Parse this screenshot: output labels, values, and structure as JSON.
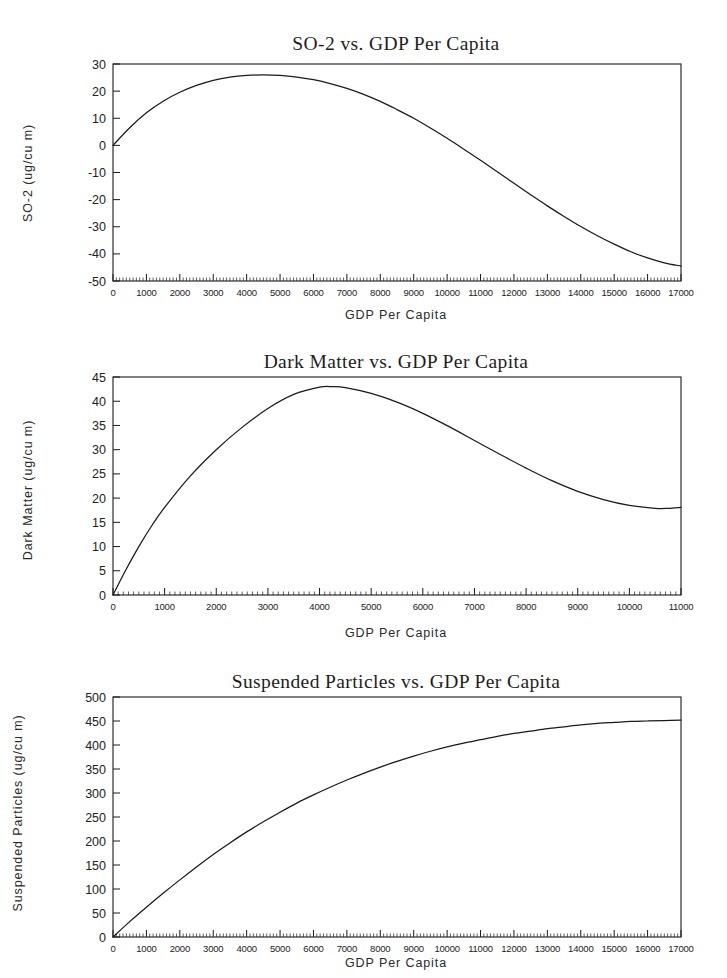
{
  "page": {
    "background_color": "#ffffff",
    "ink_color": "#1a1a1a"
  },
  "charts": [
    {
      "id": "so2",
      "title": "SO-2 vs. GDP Per Capita",
      "xlabel": "GDP Per Capita",
      "ylabel": "SO-2 (ug/cu m)",
      "yticks": [
        "30",
        "20",
        "10",
        "0",
        "-10",
        "-20",
        "-30",
        "-40",
        "-50"
      ],
      "xticks": [
        "0",
        "1000",
        "2000",
        "3000",
        "4000",
        "5000",
        "6000",
        "7000",
        "8000",
        "9000",
        "10000",
        "11000",
        "12000",
        "13000",
        "14000",
        "15000",
        "16000",
        "17000"
      ]
    },
    {
      "id": "dark-matter",
      "title": "Dark Matter vs. GDP Per Capita",
      "xlabel": "GDP Per Capita",
      "ylabel": "Dark Matter (ug/cu m)",
      "yticks": [
        "45",
        "40",
        "35",
        "30",
        "25",
        "20",
        "15",
        "10",
        "5",
        "0"
      ],
      "xticks": [
        "0",
        "1000",
        "2000",
        "3000",
        "4000",
        "5000",
        "6000",
        "7000",
        "8000",
        "9000",
        "10000",
        "11000"
      ]
    },
    {
      "id": "suspended-particles",
      "title": "Suspended Particles vs. GDP Per Capita",
      "xlabel": "GDP Per Capita",
      "ylabel": "Suspended Particles (ug/cu m)",
      "yticks": [
        "500",
        "450",
        "400",
        "350",
        "300",
        "250",
        "200",
        "150",
        "100",
        "50",
        "0"
      ],
      "xticks": [
        "0",
        "1000",
        "2000",
        "3000",
        "4000",
        "5000",
        "6000",
        "7000",
        "8000",
        "9000",
        "10000",
        "11000",
        "12000",
        "13000",
        "14000",
        "15000",
        "16000",
        "17000"
      ]
    }
  ],
  "chart_data": [
    {
      "type": "line",
      "title": "SO-2 vs. GDP Per Capita",
      "xlabel": "GDP Per Capita",
      "ylabel": "SO-2 (ug/cu m)",
      "xlim": [
        0,
        17000
      ],
      "ylim": [
        -50,
        30
      ],
      "xtick_step": 1000,
      "ytick_step": 10,
      "minor_ticks": true,
      "grid": false,
      "legend": "none",
      "x": [
        0,
        500,
        1000,
        1500,
        2000,
        2500,
        3000,
        3500,
        4000,
        4500,
        5000,
        5500,
        6000,
        6500,
        7000,
        7500,
        8000,
        8500,
        9000,
        9500,
        10000,
        10500,
        11000,
        11500,
        12000,
        12500,
        13000,
        13500,
        14000,
        14500,
        15000,
        15500,
        16000,
        16500,
        17000
      ],
      "y": [
        0,
        6.5,
        12.0,
        16.3,
        19.6,
        22.1,
        24.0,
        25.2,
        25.8,
        26.0,
        25.8,
        25.2,
        24.2,
        22.8,
        21.0,
        18.8,
        16.2,
        13.2,
        10.0,
        6.4,
        2.6,
        -1.4,
        -5.5,
        -9.7,
        -14.0,
        -18.2,
        -22.3,
        -26.2,
        -29.9,
        -33.3,
        -36.4,
        -39.2,
        -41.5,
        -43.3,
        -44.5
      ]
    },
    {
      "type": "line",
      "title": "Dark Matter vs. GDP Per Capita",
      "xlabel": "GDP Per Capita",
      "ylabel": "Dark Matter (ug/cu m)",
      "xlim": [
        0,
        11000
      ],
      "ylim": [
        0,
        45
      ],
      "xtick_step": 1000,
      "ytick_step": 5,
      "minor_ticks": true,
      "grid": false,
      "legend": "none",
      "x": [
        0,
        250,
        500,
        750,
        1000,
        1500,
        2000,
        2500,
        3000,
        3500,
        4000,
        4250,
        4500,
        5000,
        5500,
        6000,
        6500,
        7000,
        7500,
        8000,
        8500,
        9000,
        9500,
        10000,
        10500,
        10750,
        11000
      ],
      "y": [
        0,
        5.2,
        10.0,
        14.3,
        18.1,
        24.6,
        30.0,
        34.6,
        38.5,
        41.4,
        42.9,
        43.0,
        42.8,
        41.6,
        39.8,
        37.5,
        34.8,
        31.9,
        29.0,
        26.2,
        23.6,
        21.4,
        19.7,
        18.5,
        17.9,
        17.9,
        18.1
      ]
    },
    {
      "type": "line",
      "title": "Suspended Particles vs. GDP Per Capita",
      "xlabel": "GDP Per Capita",
      "ylabel": "Suspended Particles (ug/cu m)",
      "xlim": [
        0,
        17000
      ],
      "ylim": [
        0,
        500
      ],
      "xtick_step": 1000,
      "ytick_step": 50,
      "minor_ticks": true,
      "grid": false,
      "legend": "none",
      "x": [
        0,
        500,
        1000,
        1500,
        2000,
        2500,
        3000,
        3500,
        4000,
        4500,
        5000,
        5500,
        6000,
        6500,
        7000,
        7500,
        8000,
        8500,
        9000,
        9500,
        10000,
        10500,
        11000,
        11500,
        12000,
        12500,
        13000,
        13500,
        14000,
        14500,
        15000,
        15500,
        16000,
        16500,
        17000
      ],
      "y": [
        0,
        32,
        62,
        91,
        119,
        146,
        172,
        196,
        219,
        240,
        260,
        279,
        296,
        312,
        327,
        341,
        354,
        366,
        377,
        387,
        396,
        404,
        411,
        418,
        424,
        429,
        434,
        438,
        442,
        445,
        447,
        449,
        450,
        451,
        452
      ]
    }
  ]
}
